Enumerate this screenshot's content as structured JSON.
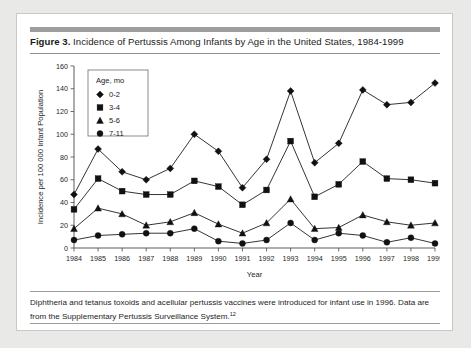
{
  "figure": {
    "number_label": "Figure 3.",
    "caption": " Incidence of Pertussis Among Infants by Age in the United States, 1984-1999",
    "footnote_text": "Diphtheria and tetanus toxoids and acellular pertussis vaccines were introduced for infant use in 1996. Data are from the Supplementary Pertussis Surveillance System.",
    "footnote_superscript": "12"
  },
  "chart_data": {
    "type": "line",
    "title": "Incidence of Pertussis Among Infants by Age in the United States, 1984-1999",
    "xlabel": "Year",
    "ylabel": "Incidence per 100 000 Infant Population",
    "legend_title": "Age, mo",
    "legend_position": "top-left-inside",
    "grid": false,
    "x": [
      1984,
      1985,
      1986,
      1987,
      1988,
      1989,
      1990,
      1991,
      1992,
      1993,
      1994,
      1995,
      1996,
      1997,
      1998,
      1999
    ],
    "categories": [
      "1984",
      "1985",
      "1986",
      "1987",
      "1988",
      "1989",
      "1990",
      "1991",
      "1992",
      "1993",
      "1994",
      "1995",
      "1996",
      "1997",
      "1998",
      "1999"
    ],
    "xlim": [
      1984,
      1999
    ],
    "ylim": [
      0,
      160
    ],
    "yticks": [
      0,
      20,
      40,
      60,
      80,
      100,
      120,
      140,
      160
    ],
    "ytick_labels": [
      "0",
      "20",
      "40",
      "60",
      "80",
      "100",
      "120",
      "140",
      "160"
    ],
    "series": [
      {
        "name": "0-2",
        "marker": "diamond",
        "color": "#111111",
        "values": [
          47,
          87,
          67,
          60,
          70,
          100,
          85,
          53,
          78,
          138,
          75,
          92,
          139,
          126,
          128,
          145
        ]
      },
      {
        "name": "3-4",
        "marker": "square",
        "color": "#111111",
        "values": [
          34,
          61,
          50,
          47,
          47,
          59,
          54,
          38,
          51,
          94,
          45,
          56,
          76,
          61,
          60,
          57
        ]
      },
      {
        "name": "5-6",
        "marker": "triangle",
        "color": "#111111",
        "values": [
          17,
          35,
          30,
          20,
          23,
          31,
          21,
          13,
          22,
          43,
          17,
          18,
          29,
          23,
          20,
          22
        ]
      },
      {
        "name": "7-11",
        "marker": "circle",
        "color": "#111111",
        "values": [
          7,
          11,
          12,
          13,
          13,
          17,
          6,
          4,
          7,
          22,
          7,
          13,
          11,
          5,
          9,
          4
        ]
      }
    ]
  }
}
